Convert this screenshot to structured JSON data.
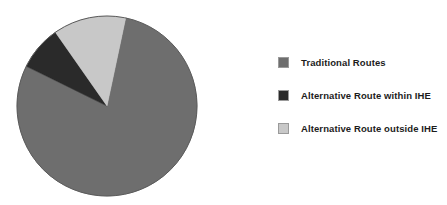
{
  "chart_data": {
    "type": "pie",
    "title": "",
    "labels": [
      "Traditional Routes",
      "Alternative Route within IHE",
      "Alternative Route outside IHE"
    ],
    "values": [
      84.5,
      8.0,
      7.5
    ],
    "unit": "%",
    "colors": [
      "#6e6e6e",
      "#2a2a2a",
      "#c8c8c8"
    ],
    "legend_position": "right",
    "grid": false,
    "start_angle_deg": 12,
    "direction": "clockwise",
    "slices": [
      {
        "label": "Traditional Routes",
        "value": 84.5,
        "color": "#6e6e6e",
        "start_deg": 12,
        "end_deg": 296.2
      },
      {
        "label": "Alternative Route within IHE",
        "value": 8.0,
        "color": "#2a2a2a",
        "start_deg": 296.2,
        "end_deg": 325.0
      },
      {
        "label": "Alternative Route outside IHE",
        "value": 7.5,
        "color": "#c8c8c8",
        "start_deg": 325.0,
        "end_deg": 372.0
      }
    ]
  },
  "legend": {
    "items": [
      {
        "label": "Traditional Routes",
        "color": "#6e6e6e",
        "swatch": "legend-swatch-traditional-routes"
      },
      {
        "label": "Alternative Route within IHE",
        "color": "#2a2a2a",
        "swatch": "legend-swatch-alternative-within-ihe"
      },
      {
        "label": "Alternative Route outside IHE",
        "color": "#c8c8c8",
        "swatch": "legend-swatch-alternative-outside-ihe"
      }
    ]
  },
  "figure": {
    "background": "#ffffff",
    "outline_color": "#5a5a5a"
  }
}
